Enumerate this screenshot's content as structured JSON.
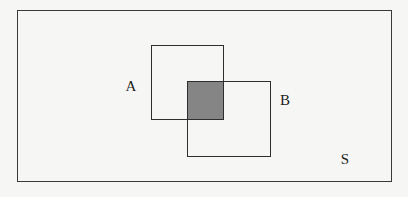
{
  "diagram": {
    "type": "venn",
    "universe": {
      "label": "S"
    },
    "sets": [
      {
        "id": "A",
        "label": "A",
        "shape": "rectangle"
      },
      {
        "id": "B",
        "label": "B",
        "shape": "rectangle"
      }
    ],
    "shaded_region": {
      "description": "A ∩ B",
      "color": "#858585"
    },
    "colors": {
      "background": "#f6f6f5",
      "stroke": "#2e2e2e",
      "shade": "#858585",
      "text": "#1e1e1e"
    }
  }
}
